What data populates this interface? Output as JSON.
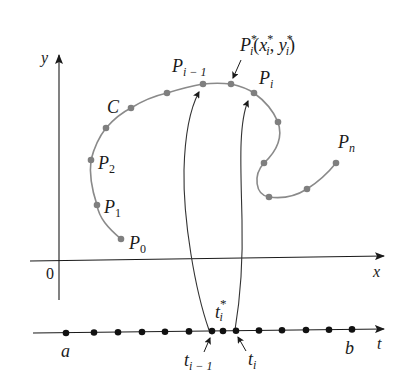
{
  "figure": {
    "axes": {
      "x_label": "x",
      "y_label": "y",
      "origin_label": "0",
      "t_label": "t"
    },
    "curve": {
      "name": "C",
      "color": "#8a8a8a",
      "points": [
        {
          "label": "P0",
          "x": 121,
          "y": 239
        },
        {
          "label": "P1",
          "x": 97,
          "y": 205
        },
        {
          "label": "P2",
          "x": 91,
          "y": 160
        },
        {
          "label": "",
          "x": 106,
          "y": 128
        },
        {
          "label": "",
          "x": 131,
          "y": 108
        },
        {
          "label": "",
          "x": 167,
          "y": 93
        },
        {
          "label": "P_{i-1}",
          "x": 203,
          "y": 84
        },
        {
          "label": "P_i*",
          "x": 231,
          "y": 84
        },
        {
          "label": "P_i",
          "x": 254,
          "y": 93
        },
        {
          "label": "",
          "x": 278,
          "y": 122
        },
        {
          "label": "",
          "x": 264,
          "y": 163
        },
        {
          "label": "",
          "x": 269,
          "y": 197
        },
        {
          "label": "",
          "x": 307,
          "y": 189
        },
        {
          "label": "P_n",
          "x": 336,
          "y": 163
        }
      ]
    },
    "labels": {
      "curve_name": "C",
      "p0": {
        "base": "P",
        "sub": "0"
      },
      "p1": {
        "base": "P",
        "sub": "1"
      },
      "p2": {
        "base": "P",
        "sub": "2"
      },
      "p_im1": {
        "base": "P",
        "sub": "i − 1"
      },
      "p_i": {
        "base": "P",
        "sub": "i"
      },
      "p_n": {
        "base": "P",
        "sub": "n"
      },
      "p_star": {
        "base": "P",
        "sup": "*",
        "sub": "i",
        "coords_open": "(",
        "x": "x",
        "x_sup": "*",
        "x_sub": "i",
        "comma": ", ",
        "y": "y",
        "y_sup": "*",
        "y_sub": "i",
        "coords_close": ")"
      },
      "a": "a",
      "b": "b",
      "t_im1": {
        "base": "t",
        "sub": "i − 1"
      },
      "t_i": {
        "base": "t",
        "sub": "i"
      },
      "t_star": {
        "base": "t",
        "sup": "*",
        "sub": "i"
      }
    },
    "t_axis_points": [
      66,
      94,
      118,
      142,
      165,
      189,
      212,
      223,
      236,
      259,
      282,
      306,
      329,
      352
    ]
  }
}
